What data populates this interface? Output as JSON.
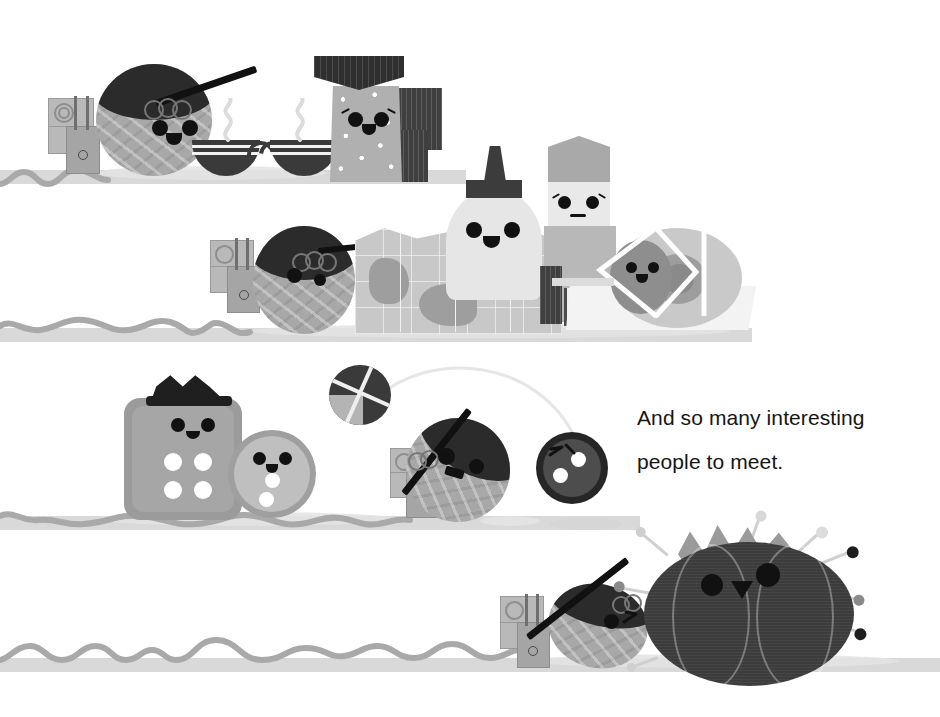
{
  "page": {
    "width": 940,
    "height": 717,
    "background": "#ffffff",
    "style": "grayscale children's picture-book illustration"
  },
  "caption": {
    "line1": "And so many interesting",
    "line2": "people to meet.",
    "color": "#151515",
    "x": 637,
    "y": 396
  },
  "palette": {
    "ink": "#111111",
    "ground": "#d9d9d9",
    "yarn_body": "#a8a8a8",
    "yarn_cap": "#2b2b2b",
    "shadow": "#d5d5d5",
    "cup_dark": "#3a3a3a",
    "button_gray": "#9b9b9b",
    "cushion_dark": "#3c3c3c",
    "leaf_gray": "#9a9a9a",
    "paper": "#ffffff"
  },
  "scenes": [
    {
      "id": "scene-breakfast",
      "label": "tea shelf",
      "shelf": {
        "x": 0,
        "y": 170,
        "width": 470,
        "height": 14
      },
      "characters": [
        {
          "name": "yarn-ball-traveler",
          "expression": "smiling",
          "accessory": "knitting-needle"
        },
        {
          "name": "backpack",
          "expression": "none",
          "accessory": "spiral-flap"
        },
        {
          "name": "teacup-left",
          "expression": "none",
          "accessory": "steam"
        },
        {
          "name": "teacup-right",
          "expression": "none",
          "accessory": "steam"
        },
        {
          "name": "salt-shaker-character",
          "expression": "happy-with-eyelashes",
          "accessory": "flat-hat"
        },
        {
          "name": "chocolate-bar-block",
          "expression": "none",
          "accessory": "none"
        }
      ]
    },
    {
      "id": "scene-map",
      "label": "map shelf",
      "shelf": {
        "x": 0,
        "y": 328,
        "width": 760,
        "height": 14
      },
      "characters": [
        {
          "name": "yarn-ball-traveler-2",
          "expression": "smiling",
          "accessory": "knitting-needle"
        },
        {
          "name": "backpack-2",
          "expression": "none",
          "accessory": "spiral-flap"
        },
        {
          "name": "folded-map",
          "expression": "none",
          "accessory": "none"
        },
        {
          "name": "glue-bottle-character",
          "expression": "smiling",
          "accessory": "dark-cap"
        },
        {
          "name": "eraser-block-character",
          "expression": "shy-with-eyelashes",
          "accessory": "none"
        },
        {
          "name": "tape-roll-character",
          "expression": "smiling",
          "accessory": "tape-dispenser"
        }
      ]
    },
    {
      "id": "scene-ball-game",
      "label": "button shelf",
      "shelf": {
        "x": 0,
        "y": 516,
        "width": 640,
        "height": 14
      },
      "characters": [
        {
          "name": "square-button-character",
          "expression": "smiling",
          "accessory": "paper-crown"
        },
        {
          "name": "round-button-character",
          "expression": "smiling",
          "accessory": "none"
        },
        {
          "name": "yarn-ball-traveler-3",
          "expression": "open-mouth",
          "accessory": "knitting-needle"
        },
        {
          "name": "dark-button-character",
          "expression": "eyes-closed",
          "accessory": "none"
        },
        {
          "name": "tossed-yarn-ball",
          "expression": "none",
          "accessory": "flight-arc"
        }
      ]
    },
    {
      "id": "scene-pincushion",
      "label": "pincushion shelf",
      "shelf": {
        "x": 0,
        "y": 658,
        "width": 940,
        "height": 14
      },
      "characters": [
        {
          "name": "yarn-ball-traveler-4",
          "expression": "winking",
          "accessory": "knitting-needle"
        },
        {
          "name": "backpack-4",
          "expression": "none",
          "accessory": "spiral-flap"
        },
        {
          "name": "tomato-pincushion-character",
          "expression": "smiling",
          "accessory": "pins-and-leaf-crown"
        }
      ]
    }
  ],
  "pins": [
    {
      "angle": -150,
      "length": 34,
      "head": "#cfcfcf"
    },
    {
      "angle": -120,
      "length": 30,
      "head": "#8a8a8a"
    },
    {
      "angle": -95,
      "length": 26,
      "head": "#e2e2e2"
    },
    {
      "angle": -60,
      "length": 36,
      "head": "#cacaca"
    },
    {
      "angle": -38,
      "length": 40,
      "head": "#1d1d1d"
    },
    {
      "angle": -12,
      "length": 34,
      "head": "#8a8a8a"
    },
    {
      "angle": 8,
      "length": 40,
      "head": "#1d1d1d"
    },
    {
      "angle": 150,
      "length": 30,
      "head": "#cfcfcf"
    },
    {
      "angle": 172,
      "length": 26,
      "head": "#8a8a8a"
    }
  ]
}
